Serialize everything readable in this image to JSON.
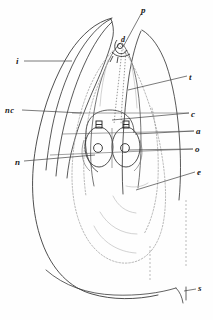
{
  "figure": {
    "medium": "engraved line illustration",
    "background_color": "#fefefe",
    "ink_color": "#2b2b2b",
    "faint_ink_color": "#8a8a8a",
    "labels": [
      {
        "key": "i",
        "text": "i",
        "side": "left",
        "x": 16,
        "y": 57,
        "leader": true
      },
      {
        "key": "nc",
        "text": "nc",
        "side": "left",
        "x": 5,
        "y": 106,
        "leader": true
      },
      {
        "key": "n",
        "text": "n",
        "side": "left",
        "x": 15,
        "y": 158,
        "leader": true
      },
      {
        "key": "p",
        "text": "p",
        "side": "top",
        "x": 141,
        "y": 6,
        "leader": true
      },
      {
        "key": "d",
        "text": "d",
        "side": "top",
        "x": 121,
        "y": 36,
        "leader": false
      },
      {
        "key": "t",
        "text": "t",
        "side": "right",
        "x": 189,
        "y": 73,
        "leader": true
      },
      {
        "key": "c",
        "text": "c",
        "side": "right",
        "x": 191,
        "y": 110,
        "leader": true
      },
      {
        "key": "a",
        "text": "a",
        "side": "right",
        "x": 196,
        "y": 127,
        "leader": true
      },
      {
        "key": "o",
        "text": "o",
        "side": "right",
        "x": 195,
        "y": 145,
        "leader": true
      },
      {
        "key": "e",
        "text": "e",
        "side": "right",
        "x": 197,
        "y": 168,
        "leader": true
      },
      {
        "key": "s",
        "text": "s",
        "side": "right",
        "x": 198,
        "y": 284,
        "leader": true
      }
    ]
  }
}
